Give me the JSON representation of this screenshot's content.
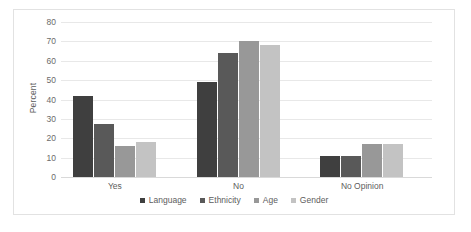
{
  "chart_data": {
    "type": "bar",
    "title": "",
    "xlabel": "",
    "ylabel": "Percent",
    "categories": [
      "Yes",
      "No",
      "No Opinion"
    ],
    "series": [
      {
        "name": "Language",
        "color": "#3f3f3f",
        "values": [
          42,
          49,
          11
        ]
      },
      {
        "name": "Ethnicity",
        "color": "#595959",
        "values": [
          27.5,
          64,
          11
        ]
      },
      {
        "name": "Age",
        "color": "#989898",
        "values": [
          16,
          70,
          17
        ]
      },
      {
        "name": "Gender",
        "color": "#c3c3c3",
        "values": [
          18,
          68,
          17
        ]
      }
    ],
    "ylim": [
      0,
      80
    ],
    "ytick_step": 10,
    "yticks": [
      0,
      10,
      20,
      30,
      40,
      50,
      60,
      70,
      80
    ],
    "ytick_labels": [
      "0",
      "10",
      "20",
      "30",
      "40",
      "50",
      "60",
      "70",
      "80"
    ],
    "grid": true,
    "legend_position": "bottom",
    "plot_background": "#ffffff",
    "gridline_color": "#e8e8e8",
    "border_color": "#e2e2e2",
    "text_color": "#5d5d5d"
  }
}
